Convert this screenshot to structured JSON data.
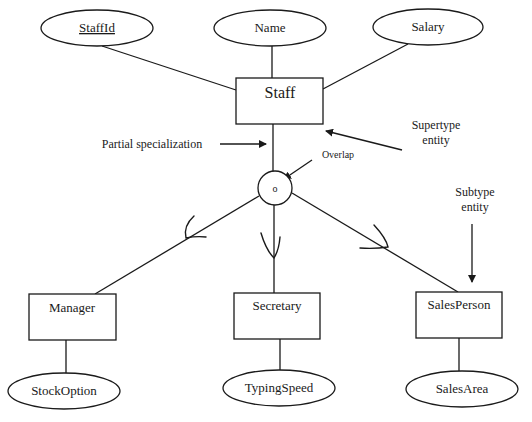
{
  "diagram": {
    "type": "EER specialization diagram",
    "supertype": {
      "name": "Staff",
      "attributes": [
        {
          "name": "StaffId",
          "key": true
        },
        {
          "name": "Name",
          "key": false
        },
        {
          "name": "Salary",
          "key": false
        }
      ]
    },
    "specialization": {
      "symbol": "o",
      "constraint": "Overlap",
      "participation": "Partial specialization"
    },
    "subtypes": [
      {
        "name": "Manager",
        "attribute": "StockOption"
      },
      {
        "name": "Secretary",
        "attribute": "TypingSpeed"
      },
      {
        "name": "SalesPerson",
        "attribute": "SalesArea"
      }
    ],
    "annotations": {
      "supertype_line1": "Supertype",
      "supertype_line2": "entity",
      "subtype_line1": "Subtype",
      "subtype_line2": "entity",
      "partial": "Partial specialization",
      "overlap": "Overlap"
    },
    "colors": {
      "stroke": "#1a1a1a",
      "background": "#ffffff"
    }
  }
}
